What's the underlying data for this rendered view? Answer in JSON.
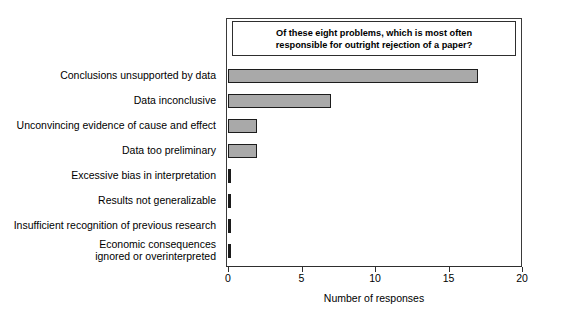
{
  "chart_data": {
    "type": "bar",
    "orientation": "horizontal",
    "title": "Of these eight problems, which is most often responsible for outright rejection of a paper?",
    "title_line1": "Of these eight problems, which is most often",
    "title_line2": "responsible for outright rejection of a paper?",
    "xlabel": "Number of responses",
    "ylabel": "",
    "xlim": [
      0,
      20
    ],
    "xticks": [
      0,
      5,
      10,
      15,
      20
    ],
    "xtick_labels": [
      "0",
      "5",
      "10",
      "15",
      "20"
    ],
    "grid": false,
    "legend": false,
    "bar_fill_color": "#a9a9a9",
    "bar_edge_color": "#1c1c1c",
    "categories": [
      "Conclusions unsupported by data",
      "Data inconclusive",
      "Unconvincing evidence of cause and effect",
      "Data too preliminary",
      "Excessive bias in interpretation",
      "Results not generalizable",
      "Insufficient recognition of previous research",
      "Economic consequences ignored or overinterpreted"
    ],
    "category_lines": [
      [
        "Conclusions unsupported by data"
      ],
      [
        "Data inconclusive"
      ],
      [
        "Unconvincing evidence of cause and effect"
      ],
      [
        "Data too preliminary"
      ],
      [
        "Excessive bias in interpretation"
      ],
      [
        "Results not generalizable"
      ],
      [
        "Insufficient recognition of previous research"
      ],
      [
        "Economic consequences",
        "ignored or overinterpreted"
      ]
    ],
    "values": [
      17,
      7,
      2,
      2,
      0,
      0,
      0,
      0
    ]
  }
}
